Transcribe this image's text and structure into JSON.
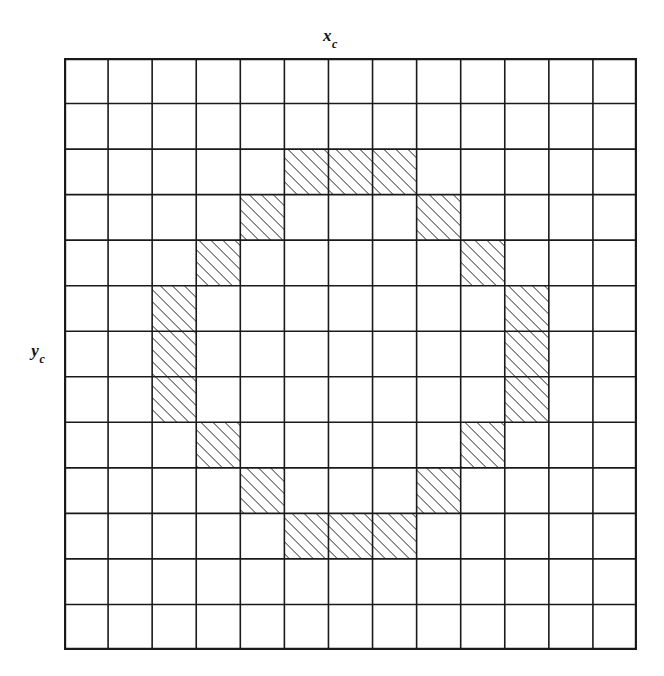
{
  "figure": {
    "type": "grid-raster-circle-diagram",
    "background_color": "#ffffff",
    "line_color": "#1a1a1a",
    "hatch_color": "#222222"
  },
  "labels": {
    "x_axis": {
      "base": "x",
      "subscript": "c",
      "text": "xc"
    },
    "y_axis": {
      "base": "y",
      "subscript": "c",
      "text": "yc"
    }
  },
  "grid": {
    "columns": 13,
    "rows": 13,
    "cell_width": 44.1,
    "cell_height": 45.5,
    "origin_x": 64,
    "origin_y": 58,
    "total_width": 573,
    "total_height": 592,
    "border_width": 2.2,
    "line_width": 1.6
  },
  "hatch": {
    "angle_degrees": 45,
    "direction": "bottom-left-to-top-right",
    "spacing": 6,
    "stroke_width": 1.4,
    "color": "#222222"
  },
  "chart_data": {
    "type": "heatmap",
    "title": "",
    "xlabel": "xc",
    "ylabel": "yc",
    "grid": true,
    "legend": "none",
    "columns": 13,
    "rows": 13,
    "shaded_cells": [
      {
        "row": 2,
        "col": 5
      },
      {
        "row": 2,
        "col": 6
      },
      {
        "row": 2,
        "col": 7
      },
      {
        "row": 3,
        "col": 4
      },
      {
        "row": 3,
        "col": 8
      },
      {
        "row": 4,
        "col": 3
      },
      {
        "row": 4,
        "col": 9
      },
      {
        "row": 5,
        "col": 2
      },
      {
        "row": 5,
        "col": 10
      },
      {
        "row": 6,
        "col": 2
      },
      {
        "row": 6,
        "col": 10
      },
      {
        "row": 7,
        "col": 2
      },
      {
        "row": 7,
        "col": 10
      },
      {
        "row": 8,
        "col": 3
      },
      {
        "row": 8,
        "col": 9
      },
      {
        "row": 9,
        "col": 4
      },
      {
        "row": 9,
        "col": 8
      },
      {
        "row": 10,
        "col": 5
      },
      {
        "row": 10,
        "col": 6
      },
      {
        "row": 10,
        "col": 7
      }
    ],
    "matrix": [
      [
        0,
        0,
        0,
        0,
        0,
        0,
        0,
        0,
        0,
        0,
        0,
        0,
        0
      ],
      [
        0,
        0,
        0,
        0,
        0,
        0,
        0,
        0,
        0,
        0,
        0,
        0,
        0
      ],
      [
        0,
        0,
        0,
        0,
        0,
        1,
        1,
        1,
        0,
        0,
        0,
        0,
        0
      ],
      [
        0,
        0,
        0,
        0,
        1,
        0,
        0,
        0,
        1,
        0,
        0,
        0,
        0
      ],
      [
        0,
        0,
        0,
        1,
        0,
        0,
        0,
        0,
        0,
        1,
        0,
        0,
        0
      ],
      [
        0,
        0,
        1,
        0,
        0,
        0,
        0,
        0,
        0,
        0,
        1,
        0,
        0
      ],
      [
        0,
        0,
        1,
        0,
        0,
        0,
        0,
        0,
        0,
        0,
        1,
        0,
        0
      ],
      [
        0,
        0,
        1,
        0,
        0,
        0,
        0,
        0,
        0,
        0,
        1,
        0,
        0
      ],
      [
        0,
        0,
        0,
        1,
        0,
        0,
        0,
        0,
        0,
        1,
        0,
        0,
        0
      ],
      [
        0,
        0,
        0,
        0,
        1,
        0,
        0,
        0,
        1,
        0,
        0,
        0,
        0
      ],
      [
        0,
        0,
        0,
        0,
        0,
        1,
        1,
        1,
        0,
        0,
        0,
        0,
        0
      ],
      [
        0,
        0,
        0,
        0,
        0,
        0,
        0,
        0,
        0,
        0,
        0,
        0,
        0
      ],
      [
        0,
        0,
        0,
        0,
        0,
        0,
        0,
        0,
        0,
        0,
        0,
        0,
        0
      ]
    ]
  }
}
